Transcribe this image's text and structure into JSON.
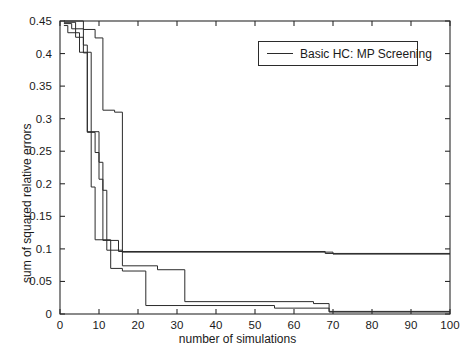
{
  "chart_data": {
    "type": "line",
    "title": "",
    "xlabel": "number of simulations",
    "ylabel": "sum of squared relative errors",
    "xlim": [
      0,
      100
    ],
    "ylim": [
      0,
      0.45
    ],
    "grid": false,
    "xticks": [
      0,
      10,
      20,
      30,
      40,
      50,
      60,
      70,
      80,
      90,
      100
    ],
    "xtick_labels": [
      "0",
      "10",
      "20",
      "30",
      "40",
      "50",
      "60",
      "70",
      "80",
      "90",
      "100"
    ],
    "yticks": [
      0,
      0.05,
      0.1,
      0.15,
      0.2,
      0.25,
      0.3,
      0.35,
      0.4,
      0.45
    ],
    "ytick_labels": [
      "0",
      "0.05",
      "0.1",
      "0.15",
      "0.2",
      "0.25",
      "0.3",
      "0.35",
      "0.4",
      "0.45"
    ],
    "legend": {
      "position": "upper-right-inside",
      "entries": [
        "Basic HC: MP Screening"
      ]
    },
    "line_color": "#2b2b2b",
    "series": [
      {
        "name": "run-1",
        "comment": "steep early drop, plateau at ~0.095 for the rest of the range",
        "points": [
          [
            1,
            0.448
          ],
          [
            4,
            0.448
          ],
          [
            4,
            0.425
          ],
          [
            6,
            0.425
          ],
          [
            6,
            0.413
          ],
          [
            7,
            0.413
          ],
          [
            7,
            0.279
          ],
          [
            9,
            0.279
          ],
          [
            9,
            0.248
          ],
          [
            10,
            0.248
          ],
          [
            10,
            0.207
          ],
          [
            11,
            0.207
          ],
          [
            11,
            0.113
          ],
          [
            15,
            0.113
          ],
          [
            15,
            0.096
          ],
          [
            68,
            0.096
          ],
          [
            68,
            0.093
          ],
          [
            100,
            0.093
          ]
        ]
      },
      {
        "name": "run-2",
        "comment": "drops through 0.40 band then to ~0.01 by x=22",
        "points": [
          [
            1,
            0.443
          ],
          [
            2,
            0.443
          ],
          [
            2,
            0.432
          ],
          [
            5,
            0.432
          ],
          [
            5,
            0.402
          ],
          [
            8,
            0.402
          ],
          [
            8,
            0.195
          ],
          [
            9,
            0.195
          ],
          [
            9,
            0.114
          ],
          [
            13,
            0.114
          ],
          [
            13,
            0.07
          ],
          [
            16,
            0.07
          ],
          [
            16,
            0.066
          ],
          [
            22,
            0.066
          ],
          [
            22,
            0.013
          ],
          [
            55,
            0.013
          ],
          [
            55,
            0.009
          ],
          [
            69,
            0.009
          ],
          [
            69,
            0.004
          ],
          [
            100,
            0.004
          ]
        ]
      },
      {
        "name": "run-3",
        "comment": "holds high until x=16 then descends in steps to near zero",
        "points": [
          [
            1,
            0.45
          ],
          [
            6,
            0.45
          ],
          [
            6,
            0.437
          ],
          [
            9,
            0.437
          ],
          [
            9,
            0.424
          ],
          [
            11,
            0.424
          ],
          [
            11,
            0.313
          ],
          [
            14,
            0.313
          ],
          [
            14,
            0.31
          ],
          [
            16,
            0.31
          ],
          [
            16,
            0.074
          ],
          [
            25,
            0.074
          ],
          [
            25,
            0.068
          ],
          [
            32,
            0.068
          ],
          [
            32,
            0.019
          ],
          [
            65,
            0.019
          ],
          [
            65,
            0.016
          ],
          [
            69,
            0.016
          ],
          [
            69,
            0.003
          ],
          [
            100,
            0.003
          ]
        ]
      },
      {
        "name": "run-4",
        "comment": "fast early decline overlapping run-2, settles lowest",
        "points": [
          [
            1,
            0.446
          ],
          [
            3,
            0.446
          ],
          [
            3,
            0.438
          ],
          [
            6,
            0.438
          ],
          [
            6,
            0.401
          ],
          [
            7,
            0.401
          ],
          [
            7,
            0.28
          ],
          [
            10,
            0.28
          ],
          [
            10,
            0.233
          ],
          [
            11,
            0.233
          ],
          [
            11,
            0.19
          ],
          [
            12,
            0.19
          ],
          [
            12,
            0.098
          ],
          [
            16,
            0.098
          ],
          [
            16,
            0.095
          ],
          [
            70,
            0.095
          ],
          [
            70,
            0.092
          ],
          [
            100,
            0.092
          ]
        ]
      }
    ]
  }
}
